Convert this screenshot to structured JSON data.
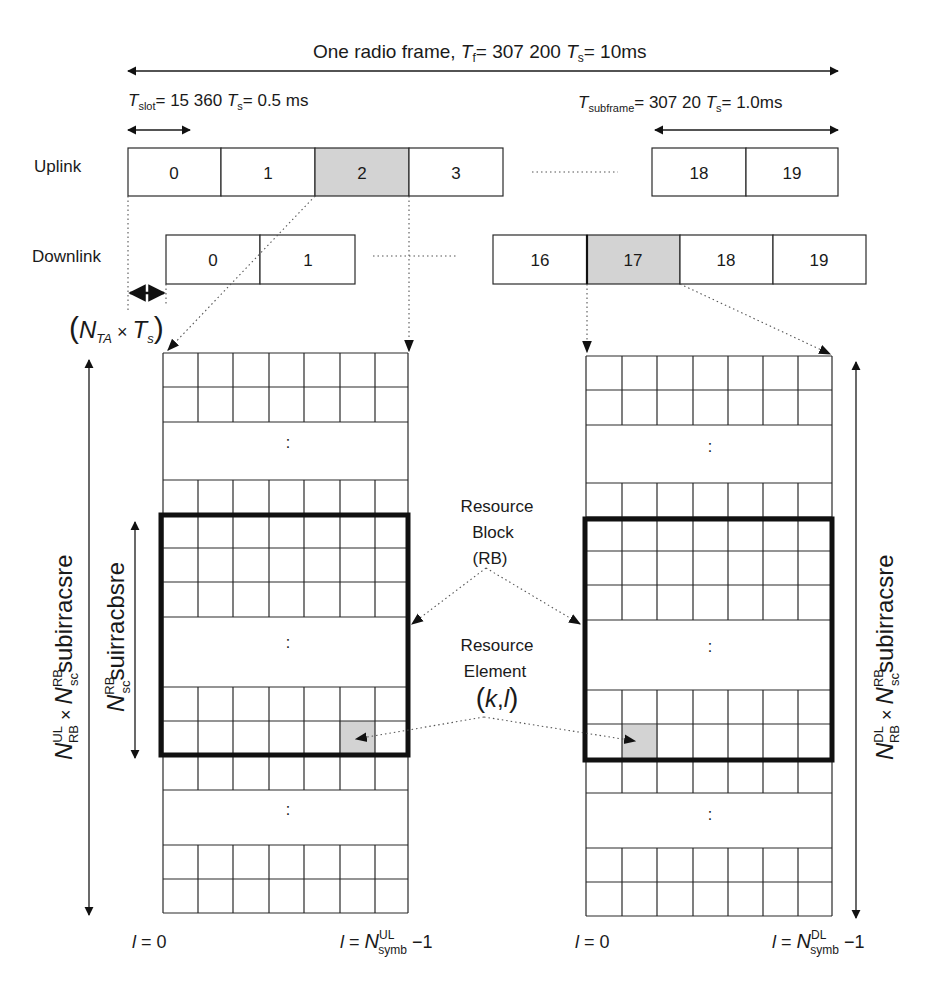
{
  "header": {
    "radio_frame": {
      "prefix": "One radio frame, ",
      "T": "T",
      "sub": "f",
      "eq": "= 307 200 ",
      "T2": "T",
      "sub2": "s",
      "tail": "= 10ms"
    },
    "slot": {
      "T": "T",
      "sub": "slot",
      "eq": "= 15 360 ",
      "T2": "T",
      "sub2": "s",
      "tail": "= 0.5 ms"
    },
    "subframe": {
      "T": "T",
      "sub": "subframe",
      "eq": "= 307 20 ",
      "T2": "T",
      "sub2": "s",
      "tail": "= 1.0ms"
    }
  },
  "uplink": {
    "label": "Uplink",
    "slots_left": [
      "0",
      "1",
      "2",
      "3"
    ],
    "slots_right": [
      "18",
      "19"
    ],
    "highlighted": "2"
  },
  "downlink": {
    "label": "Downlink",
    "slots_left": [
      "0",
      "1"
    ],
    "slots_right": [
      "16",
      "17",
      "18",
      "19"
    ],
    "highlighted": "17"
  },
  "timing_advance": {
    "open": "(",
    "N": "N",
    "sub": "TA",
    "times": " × ",
    "T": "T",
    "sub2": "s",
    "close": ")"
  },
  "grid_labels": {
    "ellipsis": ":",
    "ul_axis": {
      "N": "N",
      "sup": "UL",
      "sub": "RB",
      "times": " × ",
      "N2": "N",
      "sup2": "RB",
      "sub2": "sc",
      "tail": "subirracsre"
    },
    "rb_axis": {
      "N": "N",
      "sup": "RB",
      "sub": "sc",
      "tail": "suirracbsre"
    },
    "dl_axis": {
      "N": "N",
      "sup": "DL",
      "sub": "RB",
      "times": " × ",
      "N2": "N",
      "sup2": "RB",
      "sub2": "sc",
      "tail": "subirracsre"
    }
  },
  "annotations": {
    "resource_block": [
      "Resource",
      "Block",
      "(RB)"
    ],
    "resource_element": [
      "Resource",
      "Element"
    ],
    "re_index": {
      "open": "(",
      "k": "k",
      "comma": ",",
      "l": "l",
      "close": ")"
    }
  },
  "footer": {
    "ul_start": {
      "l": "l",
      "eq": " = 0"
    },
    "ul_end": {
      "l": "l",
      "eq": " = ",
      "N": "N",
      "sup": "UL",
      "sub": "symb",
      "tail": " −1"
    },
    "dl_start": {
      "l": "l",
      "eq": " = 0"
    },
    "dl_end": {
      "l": "l",
      "eq": " = ",
      "N": "N",
      "sup": "DL",
      "sub": "symb",
      "tail": " −1"
    }
  },
  "colors": {
    "highlight": "#d3d3d3",
    "line": "#1a1a1a",
    "background": "#ffffff"
  }
}
